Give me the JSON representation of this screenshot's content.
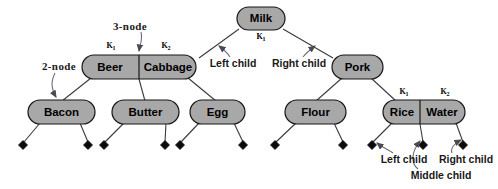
{
  "diagram": {
    "colors": {
      "node_fill": "#a8a8a8",
      "node_stroke": "#161616",
      "edge": "#3a3a3a",
      "leader": "#6e6e78",
      "leaf": "#0b0b0b",
      "background": "#ffffff"
    },
    "nodes": [
      {
        "id": "milk",
        "type": "2-node",
        "keys": [
          "Milk"
        ],
        "x": 261,
        "y": 18,
        "w": 48,
        "h": 23
      },
      {
        "id": "beer",
        "type": "3-node",
        "keys": [
          "Beer",
          "Cabbage"
        ],
        "x": 139,
        "y": 67,
        "w": 114,
        "h": 24
      },
      {
        "id": "pork",
        "type": "2-node",
        "keys": [
          "Pork"
        ],
        "x": 357,
        "y": 67,
        "w": 51,
        "h": 24
      },
      {
        "id": "bacon",
        "type": "2-node",
        "keys": [
          "Bacon"
        ],
        "x": 61,
        "y": 112,
        "w": 67,
        "h": 24
      },
      {
        "id": "butter",
        "type": "2-node",
        "keys": [
          "Butter"
        ],
        "x": 145,
        "y": 112,
        "w": 67,
        "h": 24
      },
      {
        "id": "egg",
        "type": "2-node",
        "keys": [
          "Egg"
        ],
        "x": 217,
        "y": 112,
        "w": 55,
        "h": 24
      },
      {
        "id": "flour",
        "type": "2-node",
        "keys": [
          "Flour"
        ],
        "x": 315,
        "y": 112,
        "w": 61,
        "h": 24
      },
      {
        "id": "rice",
        "type": "3-node",
        "keys": [
          "Rice",
          "Water"
        ],
        "x": 424,
        "y": 112,
        "w": 82,
        "h": 24
      }
    ],
    "leaves": [
      {
        "id": "leaf-1",
        "x": 23,
        "y": 145
      },
      {
        "id": "leaf-2",
        "x": 88,
        "y": 145
      },
      {
        "id": "leaf-3",
        "x": 104,
        "y": 145
      },
      {
        "id": "leaf-4",
        "x": 165,
        "y": 145
      },
      {
        "id": "leaf-5",
        "x": 180,
        "y": 145
      },
      {
        "id": "leaf-6",
        "x": 243,
        "y": 145
      },
      {
        "id": "leaf-7",
        "x": 275,
        "y": 145
      },
      {
        "id": "leaf-8",
        "x": 343,
        "y": 145
      },
      {
        "id": "leaf-9",
        "x": 372,
        "y": 145
      },
      {
        "id": "leaf-10",
        "x": 423,
        "y": 145
      },
      {
        "id": "leaf-11",
        "x": 463,
        "y": 145
      }
    ],
    "key_labels": [
      {
        "id": "milk-k1",
        "text": "K",
        "sub": "1",
        "x": 261,
        "y": 37
      },
      {
        "id": "beer-k1",
        "text": "K",
        "sub": "1",
        "x": 111,
        "y": 46
      },
      {
        "id": "beer-k2",
        "text": "K",
        "sub": "2",
        "x": 166,
        "y": 46
      },
      {
        "id": "pork-k1",
        "text": "K",
        "sub": "1",
        "x": 404,
        "y": 92
      },
      {
        "id": "pork-k2",
        "text": "K",
        "sub": "2",
        "x": 445,
        "y": 92
      }
    ],
    "annotations": {
      "three_node": {
        "label": "3-node",
        "x": 130,
        "y": 27
      },
      "two_node": {
        "label": "2-node",
        "x": 59,
        "y": 67
      },
      "left_child": {
        "label": "Left child",
        "x": 233,
        "y": 64
      },
      "right_child": {
        "label": "Right child",
        "x": 299,
        "y": 64
      },
      "leaf_left_child": {
        "label": "Left child",
        "x": 404,
        "y": 160
      },
      "leaf_middle_child": {
        "label": "Middle child",
        "x": 441,
        "y": 176
      },
      "leaf_right_child": {
        "label": "Right child",
        "x": 466,
        "y": 160
      }
    }
  }
}
